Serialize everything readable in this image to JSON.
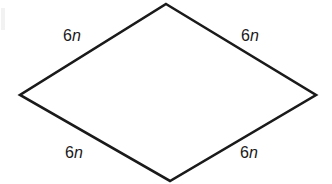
{
  "figure": {
    "name": "rhombus-with-side-labels",
    "shape": "rhombus",
    "background_color": "#ffffff",
    "stroke_color": "#1a1a1a",
    "stroke_width": 2.6,
    "fill_color": "#ffffff",
    "vertices": {
      "top": {
        "x": 166,
        "y": 4
      },
      "right": {
        "x": 316,
        "y": 95
      },
      "bottom": {
        "x": 170,
        "y": 181
      },
      "left": {
        "x": 20,
        "y": 95
      }
    },
    "polygon_points": "166,4 316,95 170,181 20,95"
  },
  "labels": {
    "top_left": {
      "coefficient": "6",
      "variable": "n"
    },
    "top_right": {
      "coefficient": "6",
      "variable": "n"
    },
    "bottom_left": {
      "coefficient": "6",
      "variable": "n"
    },
    "bottom_right": {
      "coefficient": "6",
      "variable": "n"
    }
  }
}
